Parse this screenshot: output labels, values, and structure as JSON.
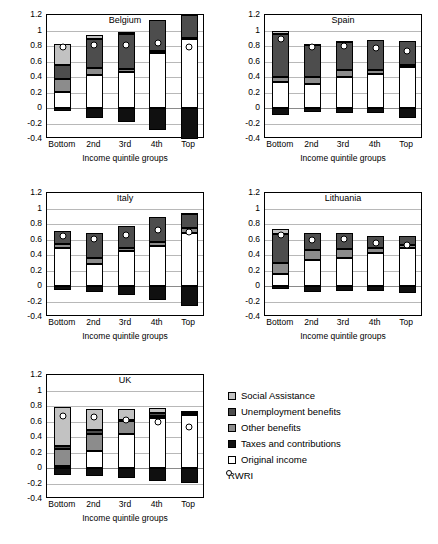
{
  "figure": {
    "axis_title": "Income quintile groups",
    "categories": [
      "Bottom",
      "2nd",
      "3rd",
      "4th",
      "Top"
    ],
    "y_ticks": [
      "1.2",
      "1",
      "0.8",
      "0.6",
      "0.4",
      "0.2",
      "0",
      "-0.2",
      "-0.4"
    ],
    "ylim": [
      -0.4,
      1.2
    ]
  },
  "legend": {
    "position": "bottom-right",
    "items": [
      {
        "key": "social",
        "label": "Social Assistance",
        "color": "#c2c2c2",
        "marker": "square"
      },
      {
        "key": "unemp",
        "label": "Unemployment benefits",
        "color": "#4d4d4d",
        "marker": "square"
      },
      {
        "key": "other",
        "label": "Other benefits",
        "color": "#8c8c8c",
        "marker": "square"
      },
      {
        "key": "taxes",
        "label": "Taxes and contributions",
        "color": "#101010",
        "marker": "square"
      },
      {
        "key": "orig",
        "label": "Original income",
        "color": "#ffffff",
        "marker": "square"
      },
      {
        "key": "rwri",
        "label": "RWRI",
        "color": "#ffffff",
        "marker": "circle"
      }
    ]
  },
  "chart_data": [
    {
      "type": "bar",
      "title": "Belgium",
      "xlabel": "Income quintile groups",
      "ylabel": "",
      "ylim": [
        -0.4,
        1.2
      ],
      "grid": true,
      "stacked": true,
      "categories": [
        "Bottom",
        "2nd",
        "3rd",
        "4th",
        "Top"
      ],
      "series": [
        {
          "name": "Original income",
          "values": [
            0.21,
            0.42,
            0.47,
            0.71,
            0.89
          ]
        },
        {
          "name": "Other benefits",
          "values": [
            0.16,
            0.1,
            0.03,
            0.02,
            0.01
          ]
        },
        {
          "name": "Unemployment benefits",
          "values": [
            0.19,
            0.37,
            0.46,
            0.41,
            0.3
          ]
        },
        {
          "name": "Social Assistance",
          "values": [
            0.27,
            0.05,
            0.02,
            0.0,
            0.0
          ]
        },
        {
          "name": "Taxes and contributions",
          "values": [
            -0.04,
            -0.13,
            -0.18,
            -0.29,
            -0.4
          ]
        }
      ],
      "rwri": [
        0.79,
        0.81,
        0.81,
        0.84,
        0.79
      ]
    },
    {
      "type": "bar",
      "title": "Spain",
      "xlabel": "Income quintile groups",
      "ylabel": "",
      "ylim": [
        -0.4,
        1.2
      ],
      "grid": true,
      "stacked": true,
      "categories": [
        "Bottom",
        "2nd",
        "3rd",
        "4th",
        "Top"
      ],
      "series": [
        {
          "name": "Original income",
          "values": [
            0.335,
            0.305,
            0.405,
            0.445,
            0.525
          ]
        },
        {
          "name": "Other benefits",
          "values": [
            0.07,
            0.09,
            0.085,
            0.045,
            0.03
          ]
        },
        {
          "name": "Unemployment benefits",
          "values": [
            0.55,
            0.43,
            0.365,
            0.385,
            0.305
          ]
        },
        {
          "name": "Social Assistance",
          "values": [
            0.045,
            0.005,
            0.005,
            0.0,
            0.0
          ]
        },
        {
          "name": "Taxes and contributions",
          "values": [
            -0.095,
            -0.05,
            -0.065,
            -0.065,
            -0.13
          ]
        }
      ],
      "rwri": [
        0.895,
        0.785,
        0.795,
        0.78,
        0.735
      ]
    },
    {
      "type": "bar",
      "title": "Italy",
      "xlabel": "Income quintile groups",
      "ylabel": "",
      "ylim": [
        -0.4,
        1.2
      ],
      "grid": true,
      "stacked": true,
      "categories": [
        "Bottom",
        "2nd",
        "3rd",
        "4th",
        "Top"
      ],
      "series": [
        {
          "name": "Original income",
          "values": [
            0.495,
            0.285,
            0.455,
            0.51,
            0.68
          ]
        },
        {
          "name": "Other benefits",
          "values": [
            0.045,
            0.075,
            0.035,
            0.055,
            0.065
          ]
        },
        {
          "name": "Unemployment benefits",
          "values": [
            0.17,
            0.325,
            0.29,
            0.32,
            0.195
          ]
        },
        {
          "name": "Social Assistance",
          "values": [
            0.0,
            0.0,
            0.0,
            0.0,
            0.005
          ]
        },
        {
          "name": "Taxes and contributions",
          "values": [
            -0.055,
            -0.075,
            -0.115,
            -0.175,
            -0.255
          ]
        }
      ],
      "rwri": [
        0.645,
        0.61,
        0.655,
        0.72,
        0.7
      ]
    },
    {
      "type": "bar",
      "title": "Lithuania",
      "xlabel": "Income quintile groups",
      "ylabel": "",
      "ylim": [
        -0.4,
        1.2
      ],
      "grid": true,
      "stacked": true,
      "categories": [
        "Bottom",
        "2nd",
        "3rd",
        "4th",
        "Top"
      ],
      "series": [
        {
          "name": "Original income",
          "values": [
            0.155,
            0.34,
            0.365,
            0.42,
            0.49
          ]
        },
        {
          "name": "Other benefits",
          "values": [
            0.145,
            0.13,
            0.115,
            0.075,
            0.045
          ]
        },
        {
          "name": "Unemployment benefits",
          "values": [
            0.375,
            0.215,
            0.21,
            0.145,
            0.115
          ]
        },
        {
          "name": "Social Assistance",
          "values": [
            0.055,
            0.0,
            0.0,
            0.0,
            0.0
          ]
        },
        {
          "name": "Taxes and contributions",
          "values": [
            -0.045,
            -0.075,
            -0.065,
            -0.065,
            -0.095
          ]
        }
      ],
      "rwri": [
        0.655,
        0.595,
        0.61,
        0.555,
        0.525
      ]
    },
    {
      "type": "bar",
      "title": "UK",
      "xlabel": "Income quintile groups",
      "ylabel": "",
      "ylim": [
        -0.4,
        1.2
      ],
      "grid": true,
      "stacked": true,
      "categories": [
        "Bottom",
        "2nd",
        "3rd",
        "4th",
        "Top"
      ],
      "series": [
        {
          "name": "Original income",
          "values": [
            0.02,
            0.225,
            0.445,
            0.645,
            0.685
          ]
        },
        {
          "name": "Other benefits",
          "values": [
            0.23,
            0.215,
            0.165,
            0.03,
            0.015
          ]
        },
        {
          "name": "Unemployment benefits",
          "values": [
            0.04,
            0.045,
            0.015,
            0.035,
            0.025
          ]
        },
        {
          "name": "Social Assistance",
          "values": [
            0.5,
            0.27,
            0.135,
            0.065,
            0.005
          ]
        },
        {
          "name": "Taxes and contributions",
          "values": [
            -0.095,
            -0.105,
            -0.13,
            -0.17,
            -0.195
          ]
        }
      ],
      "rwri": [
        0.675,
        0.655,
        0.625,
        0.6,
        0.53
      ]
    }
  ]
}
